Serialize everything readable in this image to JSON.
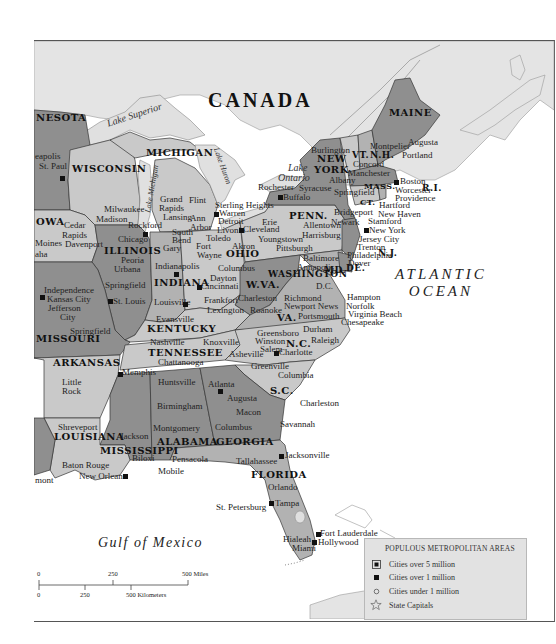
{
  "map": {
    "country_label": "CANADA",
    "ocean_label_line1": "ATLANTIC",
    "ocean_label_line2": "OCEAN",
    "gulf_label": "Gulf of Mexico",
    "lakes": {
      "superior": "Lake Superior",
      "michigan": "Lake Michigan",
      "huron": "Lake Huron",
      "ontario_line1": "Lake",
      "ontario_line2": "Ontario"
    },
    "states": {
      "minnesota": "NESOTA",
      "wisconsin": "WISCONSIN",
      "michigan": "MICHIGAN",
      "iowa": "OWA",
      "illinois": "ILLINOIS",
      "indiana": "INDIANA",
      "ohio": "OHIO",
      "maine": "MAINE",
      "new_york_1": "NEW",
      "new_york_2": "YORK",
      "vermont": "VT.",
      "new_hampshire": "N.H.",
      "massachusetts": "MASS.",
      "rhode_island": "R.I.",
      "connecticut": "CT.",
      "pennsylvania": "PENN.",
      "new_jersey": "N.J.",
      "delaware": "DE.",
      "maryland": "MD.",
      "west_virginia": "W.VA.",
      "virginia": "VA.",
      "kentucky": "KENTUCKY",
      "missouri": "MISSOURI",
      "arkansas": "ARKANSAS",
      "tennessee": "TENNESSEE",
      "north_carolina": "N.C.",
      "south_carolina": "S.C.",
      "louisiana": "LOUISIANA",
      "mississippi": "MISSISSIPPI",
      "alabama": "ALABAMA",
      "georgia": "GEORGIA",
      "florida": "FLORIDA",
      "washington_dc": "WASHINGTON",
      "dc_abbrev": "D.C."
    },
    "cities": {
      "minneapolis": "eapolis",
      "st_paul": "St. Paul",
      "milwaukee": "Milwaukee",
      "madison": "Madison",
      "rockford": "Rockford",
      "chicago": "Chicago",
      "gary": "Gary",
      "peoria": "Peoria",
      "urbana": "Urbana",
      "springfield_il": "Springfield",
      "st_louis": "St. Louis",
      "cedar_rapids_1": "Cedar",
      "cedar_rapids_2": "Rapids",
      "davenport": "Davenport",
      "des_moines": "Moines",
      "omaha": "aha",
      "independence": "Independence",
      "kansas_city": "Kansas City",
      "jefferson_city_1": "Jefferson",
      "jefferson_city_2": "City",
      "springfield_mo": "Springfield",
      "grand_rapids_1": "Grand",
      "grand_rapids_2": "Rapids",
      "lansing": "Lansing",
      "flint": "Flint",
      "ann_arbor_1": "Ann",
      "ann_arbor_2": "Arbor",
      "sterling_heights": "Sterling Heights",
      "warren": "Warren",
      "detroit": "Detroit",
      "livonia": "Livonia",
      "south_bend_1": "South",
      "south_bend_2": "Bend",
      "fort_wayne_1": "Fort",
      "fort_wayne_2": "Wayne",
      "toledo": "Toledo",
      "cleveland": "Cleveland",
      "akron": "Akron",
      "youngstown": "Youngstown",
      "erie": "Erie",
      "columbus_oh": "Columbus",
      "dayton": "Dayton",
      "cincinnati": "Cincinnati",
      "indianapolis": "Indianapolis",
      "louisville": "Louisville",
      "evansville": "Evansville",
      "frankfort": "Frankfort",
      "lexington": "Lexington",
      "charleston_wv": "Charleston",
      "roanoke": "Roanoke",
      "pittsburgh": "Pittsburgh",
      "harrisburg": "Harrisburg",
      "allentown": "Allentown",
      "rochester": "Rochester",
      "buffalo": "Buffalo",
      "syracuse": "Syracuse",
      "albany": "Albany",
      "burlington": "Burlington",
      "montpelier": "Montpelier",
      "concord": "Concord",
      "manchester": "Manchester",
      "augusta_me": "Augusta",
      "portland": "Portland",
      "boston": "Boston",
      "worcester": "Worcester",
      "springfield_ma": "Springfield",
      "providence": "Providence",
      "hartford": "Hartford",
      "new_haven": "New Haven",
      "stamford": "Stamford",
      "bridgeport": "Bridgeport",
      "newark": "Newark",
      "new_york": "New York",
      "jersey_city": "Jersey City",
      "trenton": "Trenton",
      "philadelphia": "Philadelphia",
      "dover": "Dover",
      "baltimore": "Baltimore",
      "annapolis": "Annapolis",
      "richmond": "Richmond",
      "newport_news": "Newport News",
      "hampton": "Hampton",
      "norfolk": "Norfolk",
      "virginia_beach": "Virginia Beach",
      "portsmouth": "Portsmouth",
      "chesapeake": "Chesapeake",
      "greensboro": "Greensboro",
      "durham": "Durham",
      "raleigh": "Raleigh",
      "winston_salem_1": "Winston",
      "winston_salem_2": "Salem",
      "charlotte": "Charlotte",
      "asheville": "Asheville",
      "nashville": "Nashville",
      "knoxville": "Knoxville",
      "chattanooga": "Chattanooga",
      "memphis": "Memphis",
      "little_rock_1": "Little",
      "little_rock_2": "Rock",
      "greenville": "Greenville",
      "columbia": "Columbia",
      "charleston_sc": "Charleston",
      "savannah": "Savannah",
      "atlanta": "Atlanta",
      "augusta_ga": "Augusta",
      "macon": "Macon",
      "columbus_ga": "Columbus",
      "huntsville": "Huntsville",
      "birmingham": "Birmingham",
      "montgomery": "Montgomery",
      "jackson": "Jackson",
      "shreveport": "Shreveport",
      "baton_rouge": "Baton Rouge",
      "new_orleans": "New Orleans",
      "biloxi": "Biloxi",
      "mobile": "Mobile",
      "pensacola": "Pensacola",
      "tallahassee": "Tallahassee",
      "jacksonville": "Jacksonville",
      "orlando": "Orlando",
      "tampa": "Tampa",
      "st_petersburg": "St. Petersburg",
      "fort_lauderdale": "Fort Lauderdale",
      "hollywood": "Hollywood",
      "hialeah": "Hialeah",
      "miami": "Miami",
      "beaumont": "mont"
    }
  },
  "scale": {
    "miles_ticks": [
      "0",
      "250",
      "500 Miles"
    ],
    "km_ticks": [
      "0",
      "250",
      "500 Kilometers"
    ]
  },
  "legend": {
    "title": "POPULOUS METROPOLITAN AREAS",
    "items": [
      {
        "symbol": "boxed-square",
        "label": "Cities over 5 million"
      },
      {
        "symbol": "filled-square",
        "label": "Cities over 1 million"
      },
      {
        "symbol": "open-circle",
        "label": "Cities under 1 million"
      },
      {
        "symbol": "star",
        "label": "State Capitals"
      }
    ]
  },
  "colors": {
    "water": "#ffffff",
    "canada_land": "#e4e4e4",
    "lake": "#e0e0e0",
    "state_light": "#c9c9c9",
    "state_mid": "#b2b2b2",
    "state_dark": "#8f8f8f",
    "border": "#333333"
  }
}
